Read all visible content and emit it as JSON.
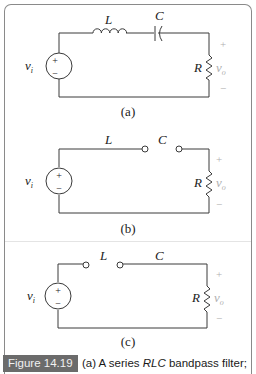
{
  "figure": {
    "panels": [
      {
        "id": "a",
        "label": "(a)",
        "source_label": "v",
        "source_subscript": "i",
        "inductor_label": "L",
        "capacitor_label": "C",
        "resistor_label": "R",
        "output_label": "v",
        "output_subscript": "o",
        "plus": "+",
        "minus": "−"
      },
      {
        "id": "b",
        "label": "(b)",
        "source_label": "v",
        "source_subscript": "i",
        "inductor_label": "L",
        "capacitor_label": "C",
        "resistor_label": "R",
        "output_label": "v",
        "output_subscript": "o",
        "plus": "+",
        "minus": "−"
      },
      {
        "id": "c",
        "label": "(c)",
        "source_label": "v",
        "source_subscript": "i",
        "inductor_label": "L",
        "capacitor_label": "C",
        "resistor_label": "R",
        "output_label": "v",
        "output_subscript": "o",
        "plus": "+",
        "minus": "−"
      }
    ],
    "caption": {
      "tag": "Figure 14.19",
      "text_prefix": "(a) A series ",
      "text_italic": "RLC",
      "text_suffix": " bandpass filter;"
    },
    "colors": {
      "wire": "#3a3a3a",
      "polarity": "#b0b0b0",
      "tag_bg": "#6b6b6b"
    }
  }
}
